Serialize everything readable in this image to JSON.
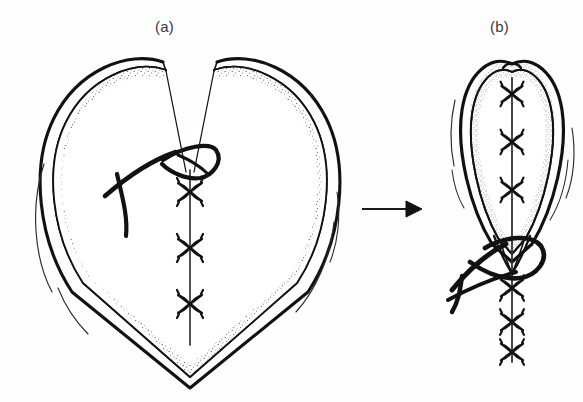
{
  "figure": {
    "type": "surgical-line-drawing",
    "background_color": "#fefefe",
    "ink_color": "#111111",
    "stipple_color": "#6b6b6b",
    "width": 583,
    "height": 402,
    "panels": [
      {
        "id": "a",
        "label": "(a)",
        "label_x": 155,
        "label_y": 18,
        "caption_text": "(a)",
        "description": "Heart-shaped tissue defect held open, vertical row of interrupted sutures with curved needle and thread at top",
        "knot_count": 3,
        "shape": "heart-open"
      },
      {
        "id": "b",
        "label": "(b)",
        "label_x": 490,
        "label_y": 18,
        "caption_text": "(b)",
        "description": "Defect drawn closed into a narrow teardrop, six interrupted suture knots along the midline with needle and thread",
        "knot_count": 6,
        "shape": "teardrop-closed"
      }
    ],
    "arrow": {
      "name": "transition-arrow",
      "x1": 362,
      "y1": 209,
      "x2": 418,
      "y2": 209,
      "direction": "right"
    }
  }
}
